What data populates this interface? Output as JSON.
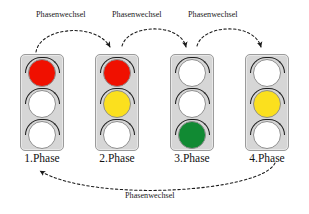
{
  "diagram": {
    "background_color": "#ffffff",
    "colors": {
      "red": "#f01000",
      "yellow": "#fbe01e",
      "green": "#118a33",
      "off": "#ffffff",
      "housing": "#d6d6d6",
      "housing_border": "#9b9b9b",
      "visor": "#1d1d1d",
      "arrow": "#1a1a1a",
      "text": "#111111"
    }
  },
  "lights": [
    {
      "id": "phase-1",
      "label": "1.Phase",
      "x": 18,
      "y": 54,
      "lamps": [
        {
          "name": "red-lamp",
          "state": "on",
          "color": "#f01000"
        },
        {
          "name": "yellow-lamp",
          "state": "off",
          "color": "#ffffff"
        },
        {
          "name": "green-lamp",
          "state": "off",
          "color": "#ffffff"
        }
      ]
    },
    {
      "id": "phase-2",
      "label": "2.Phase",
      "x": 93,
      "y": 54,
      "lamps": [
        {
          "name": "red-lamp",
          "state": "on",
          "color": "#f01000"
        },
        {
          "name": "yellow-lamp",
          "state": "on",
          "color": "#fbe01e"
        },
        {
          "name": "green-lamp",
          "state": "off",
          "color": "#ffffff"
        }
      ]
    },
    {
      "id": "phase-3",
      "label": "3.Phase",
      "x": 168,
      "y": 54,
      "lamps": [
        {
          "name": "red-lamp",
          "state": "off",
          "color": "#ffffff"
        },
        {
          "name": "yellow-lamp",
          "state": "off",
          "color": "#ffffff"
        },
        {
          "name": "green-lamp",
          "state": "on",
          "color": "#118a33"
        }
      ]
    },
    {
      "id": "phase-4",
      "label": "4.Phase",
      "x": 243,
      "y": 54,
      "lamps": [
        {
          "name": "red-lamp",
          "state": "off",
          "color": "#ffffff"
        },
        {
          "name": "yellow-lamp",
          "state": "on",
          "color": "#fbe01e"
        },
        {
          "name": "green-lamp",
          "state": "off",
          "color": "#ffffff"
        }
      ]
    }
  ],
  "transitions": [
    {
      "id": "t1",
      "label": "Phasenwechsel",
      "from": "phase-1",
      "to": "phase-2",
      "label_x": 36,
      "label_y": 10
    },
    {
      "id": "t2",
      "label": "Phasenwechsel",
      "from": "phase-2",
      "to": "phase-3",
      "label_x": 112,
      "label_y": 10
    },
    {
      "id": "t3",
      "label": "Phasenwechsel",
      "from": "phase-3",
      "to": "phase-4",
      "label_x": 188,
      "label_y": 10
    },
    {
      "id": "t4",
      "label": "Phasenwechsel",
      "from": "phase-4",
      "to": "phase-1",
      "label_x": 123,
      "label_y": 191
    }
  ]
}
